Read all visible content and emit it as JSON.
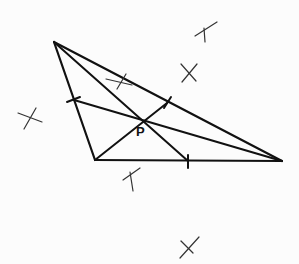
{
  "diagram": {
    "type": "triangle-cevians",
    "point_label": "P",
    "vertices": {
      "A": [
        54,
        42
      ],
      "B": [
        95,
        160
      ],
      "C": [
        282,
        161
      ]
    },
    "point_P": [
      141,
      123
    ],
    "cevian_feet": {
      "on_AB": [
        74,
        100
      ],
      "on_AC": [
        167,
        103
      ],
      "on_BC": [
        188,
        161
      ]
    },
    "construction_marks": [
      [
        26,
        118
      ],
      [
        129,
        79
      ],
      [
        208,
        52
      ],
      [
        186,
        74
      ],
      [
        132,
        177
      ],
      [
        184,
        245
      ]
    ],
    "stroke_color": "#111111",
    "mark_color": "#333333"
  }
}
